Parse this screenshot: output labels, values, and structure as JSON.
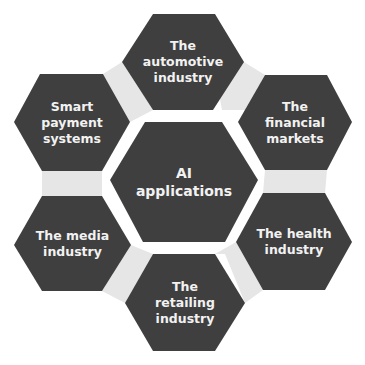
{
  "diagram": {
    "colors": {
      "hex_fill": "#3f3f3f",
      "connector_fill": "#e6e6e6",
      "text": "#f2f2f2",
      "background": "#ffffff"
    },
    "center": {
      "label": "AI\napplications"
    },
    "nodes": [
      {
        "id": "automotive",
        "label": "The\nautomotive\nindustry"
      },
      {
        "id": "financial",
        "label": "The\nfinancial\nmarkets"
      },
      {
        "id": "health",
        "label": "The health\nindustry"
      },
      {
        "id": "retailing",
        "label": "The\nretailing\nindustry"
      },
      {
        "id": "media",
        "label": "The media\nindustry"
      },
      {
        "id": "payment",
        "label": "Smart\npayment\nsystems"
      }
    ]
  }
}
